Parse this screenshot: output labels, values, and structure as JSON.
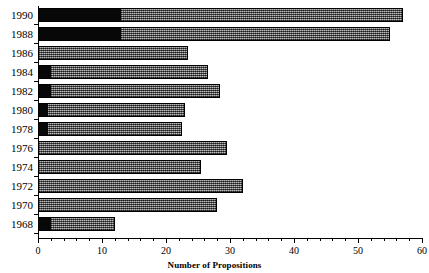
{
  "chart_data": {
    "type": "bar",
    "orientation": "horizontal",
    "title": "",
    "xlabel": "Number of Propositions",
    "ylabel": "",
    "xlim": [
      0,
      60
    ],
    "xticks": [
      0,
      10,
      20,
      30,
      40,
      50,
      60
    ],
    "xtick_labels": [
      "0",
      "10",
      "20",
      "30",
      "40",
      "50",
      "60"
    ],
    "minor_tick_interval": 2,
    "grid": false,
    "legend": null,
    "categories": [
      "1990",
      "1988",
      "1986",
      "1984",
      "1982",
      "1980",
      "1978",
      "1976",
      "1974",
      "1972",
      "1970",
      "1968"
    ],
    "values": [
      57,
      55,
      23.5,
      26.5,
      28.5,
      23,
      22.5,
      29.5,
      25.5,
      32,
      28,
      12
    ],
    "series": [
      {
        "name": "black-segment",
        "color": "#080808",
        "values": [
          13,
          13,
          0,
          2,
          2,
          1.5,
          1.5,
          0,
          0,
          0,
          0,
          2
        ]
      },
      {
        "name": "hatched-segment",
        "color": "#767676",
        "values": [
          44,
          42,
          23.5,
          24.5,
          26.5,
          21.5,
          21,
          29.5,
          25.5,
          32,
          28,
          10
        ]
      }
    ],
    "bars": [
      {
        "category": "1990",
        "total": 57,
        "black": 13,
        "hatched": 44
      },
      {
        "category": "1988",
        "total": 55,
        "black": 13,
        "hatched": 42
      },
      {
        "category": "1986",
        "total": 23.5,
        "black": 0,
        "hatched": 23.5
      },
      {
        "category": "1984",
        "total": 26.5,
        "black": 2,
        "hatched": 24.5
      },
      {
        "category": "1982",
        "total": 28.5,
        "black": 2,
        "hatched": 26.5
      },
      {
        "category": "1980",
        "total": 23,
        "black": 1.5,
        "hatched": 21.5
      },
      {
        "category": "1978",
        "total": 22.5,
        "black": 1.5,
        "hatched": 21
      },
      {
        "category": "1976",
        "total": 29.5,
        "black": 0,
        "hatched": 29.5
      },
      {
        "category": "1974",
        "total": 25.5,
        "black": 0,
        "hatched": 25.5
      },
      {
        "category": "1972",
        "total": 32,
        "black": 0,
        "hatched": 32
      },
      {
        "category": "1970",
        "total": 28,
        "black": 0,
        "hatched": 28
      },
      {
        "category": "1968",
        "total": 12,
        "black": 2,
        "hatched": 10
      }
    ]
  },
  "colors": {
    "axis": "#000000",
    "black_segment": "#080808",
    "hatched_segment": "#767676",
    "background": "#ffffff"
  }
}
